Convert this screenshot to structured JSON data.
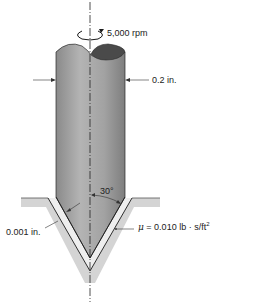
{
  "figure": {
    "labels": {
      "rotation_speed": "5,000 rpm",
      "shaft_diameter": "0.2 in.",
      "cone_half_angle": "30°",
      "film_thickness": "0.001 in.",
      "viscosity_symbol": "μ",
      "viscosity_value": " = 0.010 lb · s/ft",
      "viscosity_exponent": "2"
    },
    "colors": {
      "shaft_fill": "#9a9a9a",
      "shaft_top_face": "#4a4a4a",
      "housing_fill": "#d4d4d4",
      "oil_film_fill": "#ececec",
      "line": "#1a1a1a"
    },
    "parts": [
      "shaft",
      "housing",
      "oil-film",
      "center-axis",
      "rotation-arrow",
      "dimension-arrows"
    ]
  }
}
